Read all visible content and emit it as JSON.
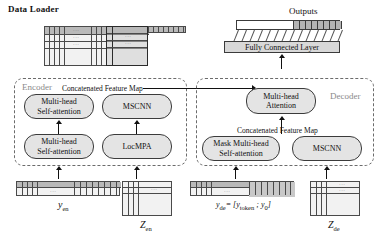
{
  "diagram": {
    "title_data_loader": "Data Loader",
    "title_outputs": "Outputs",
    "fully_connected_layer": "Fully Connected Layer",
    "encoder": {
      "label": "Encoder",
      "concat_label": "Concatenated Feature Map",
      "modules": [
        {
          "id": "enc-top-left",
          "lines": [
            "Multi-head",
            "Self-attention"
          ]
        },
        {
          "id": "enc-top-right",
          "lines": [
            "MSCNN"
          ]
        },
        {
          "id": "enc-bottom-left",
          "lines": [
            "Multi-head",
            "Self-attention"
          ]
        },
        {
          "id": "enc-bottom-right",
          "lines": [
            "LocMPA"
          ]
        }
      ],
      "inputs": [
        {
          "id": "y-en",
          "label": "y",
          "sub": "en"
        },
        {
          "id": "z-en",
          "label": "Z",
          "sub": "en"
        }
      ]
    },
    "decoder": {
      "label": "Decoder",
      "concat_label": "Concatenated Feature Map",
      "modules": [
        {
          "id": "dec-top",
          "lines": [
            "Multi-head",
            "Attention"
          ]
        },
        {
          "id": "dec-bottom-left",
          "lines": [
            "Mask Multi-head",
            "Self-attention"
          ]
        },
        {
          "id": "dec-bottom-right",
          "lines": [
            "MSCNN"
          ]
        }
      ],
      "inputs": [
        {
          "id": "y-de",
          "label": "y",
          "sub": "de",
          "equation": "= [y",
          "equation_sub1": "token",
          "equation_mid": " ; y",
          "equation_sub2": "0",
          "equation_end": "]"
        },
        {
          "id": "z-de",
          "label": "Z",
          "sub": "de"
        }
      ]
    },
    "ellipsis": "···",
    "colors": {
      "module_fill": "#e4e4e4",
      "module_stroke": "#3b3b3b",
      "region_stroke": "#6b6b6b",
      "region_label": "#8a8a8a",
      "header_fill": "#b9b9b9",
      "grid_fill": "#f2f2f2",
      "fc_fill": "#d8d8d8",
      "out_cell_fill": "#b4b4b4"
    }
  }
}
